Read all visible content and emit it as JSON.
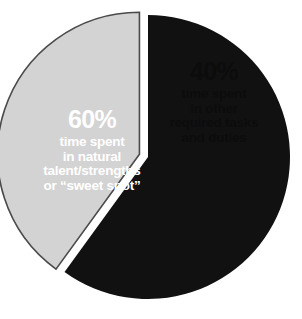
{
  "chart_data": {
    "type": "pie",
    "title": "",
    "subtitle": "",
    "xlabel": "",
    "ylabel": "",
    "legend_position": "none",
    "grid": false,
    "total": 100,
    "units": "percent",
    "categories": [
      "time spent in natural talent/strengths or \"sweet spot\"",
      "time spent in other required tasks and duties"
    ],
    "values": [
      60,
      40
    ],
    "slices": [
      {
        "name": "natural-talent-sweet-spot",
        "value": 60,
        "percent_label": "60%",
        "color": "#111111",
        "text_color": "#ffffff",
        "exploded": false,
        "start_angle_deg": 0,
        "end_angle_deg": 216,
        "description_lines": [
          "time spent",
          "in natural",
          "talent/strengths",
          "or “sweet spot”"
        ]
      },
      {
        "name": "other-required-tasks",
        "value": 40,
        "percent_label": "40%",
        "color": "#d3d3d3",
        "text_color": "#0c0c0c",
        "outline_color": "#4a4a4a",
        "exploded": true,
        "start_angle_deg": 216,
        "end_angle_deg": 360,
        "description_lines": [
          "time spent",
          "in other",
          "required tasks",
          "and duties"
        ]
      }
    ],
    "background_color": "#ffffff"
  },
  "labels": {
    "major": {
      "percent": "60%",
      "line1": "time spent",
      "line2": "in natural",
      "line3": "talent/strengths",
      "line4": "or “sweet spot”"
    },
    "minor": {
      "percent": "40%",
      "line1": "time spent",
      "line2": "in other",
      "line3": "required tasks",
      "line4": "and duties"
    }
  }
}
